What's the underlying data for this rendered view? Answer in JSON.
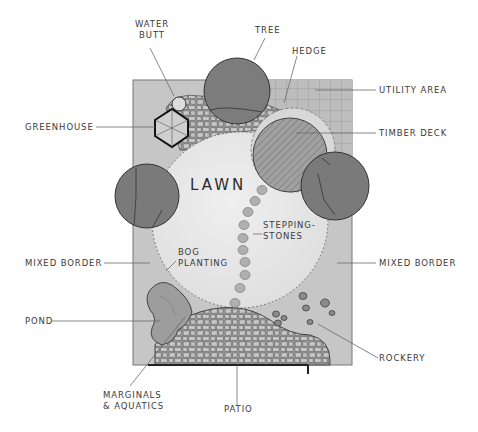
{
  "diagram": {
    "type": "garden-plan",
    "colors": {
      "background": "#ffffff",
      "border_fill": "#c4c4c4",
      "lawn_fill": "#e8e8e8",
      "tree_fill": "#7a7a7a",
      "deck_fill": "#9c9c9c",
      "paving_fill": "#b8b8b8",
      "pond_fill": "#9a9a9a",
      "line": "#3a3a3a",
      "leader": "#6a6a6a"
    },
    "center_label": "LAWN",
    "labels": {
      "water_butt": [
        "WATER",
        "BUTT"
      ],
      "tree": "TREE",
      "hedge": "HEDGE",
      "utility_area": "UTILITY AREA",
      "greenhouse": "GREENHOUSE",
      "timber_deck": "TIMBER DECK",
      "stepping_stones": [
        "STEPPING-",
        "STONES"
      ],
      "bog_planting": [
        "BOG",
        "PLANTING"
      ],
      "mixed_border_left": "MIXED BORDER",
      "mixed_border_right": "MIXED BORDER",
      "pond": "POND",
      "rockery": "ROCKERY",
      "marginals_aquatics": [
        "MARGINALS",
        "& AQUATICS"
      ],
      "patio": "PATIO"
    }
  }
}
